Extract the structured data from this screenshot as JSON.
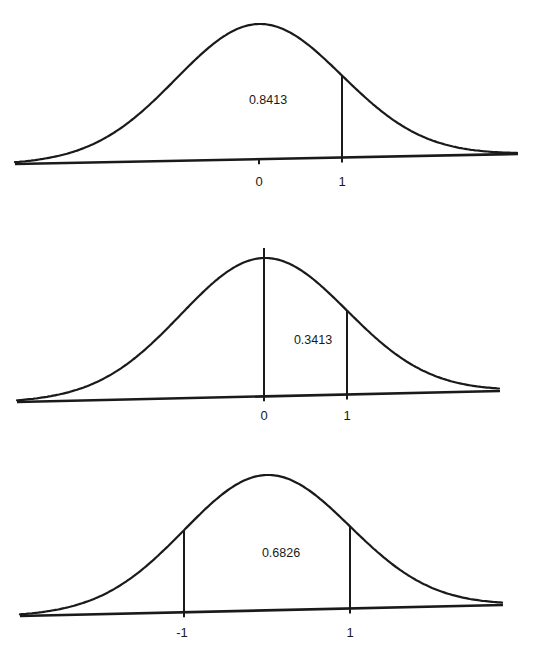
{
  "chart_data": [
    {
      "type": "area",
      "title": "P(Z < 1)",
      "area_label": "0.8413",
      "shaded_region": {
        "from": "-inf",
        "to": 1
      },
      "tick_labels": [
        "0",
        "1"
      ],
      "tick_values": [
        0,
        1
      ],
      "boundary_lines": [
        1
      ],
      "geometry": {
        "x_left": 15,
        "y_left": 164,
        "x_right": 518,
        "y_right": 154,
        "mean_x": 259,
        "sigma_px": 83,
        "peak_y": 24,
        "label_x": 268,
        "label_y": 104,
        "tick_label_y": 186,
        "mean_tick": true
      }
    },
    {
      "type": "area",
      "title": "P(0 < Z < 1)",
      "area_label": "0.3413",
      "shaded_region": {
        "from": 0,
        "to": 1
      },
      "tick_labels": [
        "0",
        "1"
      ],
      "tick_values": [
        0,
        1
      ],
      "boundary_lines": [
        0,
        1
      ],
      "geometry": {
        "x_left": 17,
        "y_left": 402,
        "x_right": 500,
        "y_right": 391,
        "mean_x": 264,
        "sigma_px": 83,
        "peak_y": 258,
        "label_x": 313,
        "label_y": 344,
        "tick_label_y": 420,
        "mean_line_top": 248,
        "mean_tick": false
      }
    },
    {
      "type": "area",
      "title": "P(-1 < Z < 1)",
      "area_label": "0.6826",
      "shaded_region": {
        "from": -1,
        "to": 1
      },
      "tick_labels": [
        "-1",
        "1"
      ],
      "tick_values": [
        -1,
        1
      ],
      "boundary_lines": [
        -1,
        1
      ],
      "geometry": {
        "x_left": 20,
        "y_left": 616,
        "x_right": 503,
        "y_right": 605,
        "mean_x": 267,
        "sigma_px": 83,
        "peak_y": 475,
        "label_x": 281,
        "label_y": 557,
        "tick_label_y": 637,
        "mean_tick": false
      }
    }
  ]
}
